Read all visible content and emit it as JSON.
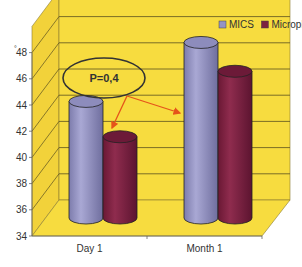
{
  "chart_data": {
    "type": "bar",
    "style": "3d-cylinder",
    "title": "",
    "xlabel": "",
    "ylabel": "",
    "categories": [
      "Day 1",
      "Month 1"
    ],
    "series": [
      {
        "name": "MICS",
        "values": [
          42.9,
          47.4
        ],
        "color": "#9594c4"
      },
      {
        "name": "Microphaco",
        "values": [
          40.2,
          45.2
        ],
        "color": "#7c2140"
      }
    ],
    "ylim": [
      34,
      50
    ],
    "yticks": [
      "34",
      "36",
      "38",
      "40",
      "42",
      "44",
      "46",
      "48"
    ],
    "grid": true,
    "legend_position": "top-right",
    "annotation": {
      "text": "P=0,4",
      "shape": "ellipse",
      "arrows_to": [
        "Day 1",
        "Month 1"
      ],
      "arrow_color": "#e5541a"
    },
    "wall_color": "#f7dc3f",
    "floor_color": "#f7dc3f"
  },
  "axis_mark": "°"
}
